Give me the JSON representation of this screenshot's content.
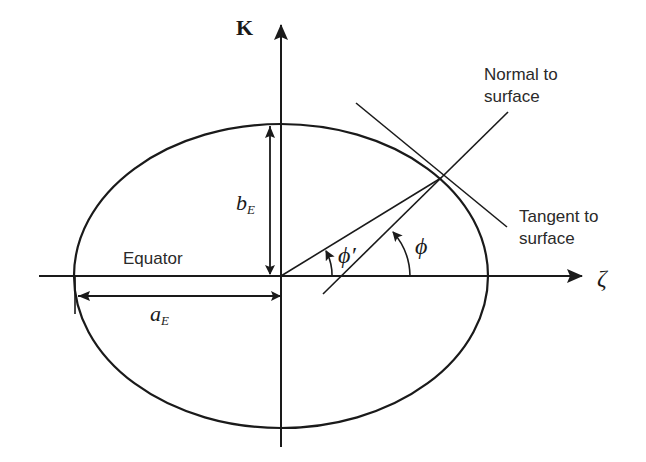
{
  "diagram": {
    "title": "",
    "axes": {
      "vertical_label": "K",
      "horizontal_label": "ζ"
    },
    "labels": {
      "equator": "Equator",
      "semi_major": {
        "base": "a",
        "sub": "E"
      },
      "semi_minor": {
        "base": "b",
        "sub": "E"
      },
      "geocentric_latitude": "ϕ′",
      "geodetic_latitude": "ϕ",
      "normal_line": [
        "Normal to",
        "surface"
      ],
      "tangent_line": [
        "Tangent to",
        "surface"
      ]
    },
    "colors": {
      "stroke": "#1a1a1a",
      "text": "#2a2a2a",
      "background": "#ffffff"
    }
  }
}
